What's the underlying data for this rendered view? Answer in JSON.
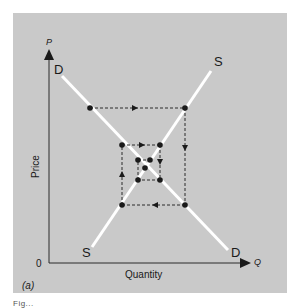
{
  "figure": {
    "panel_label": "(a)",
    "background_color": "#c9c9c9",
    "curve_color": "#ffffff",
    "axis_color": "#2a2a2a",
    "caption_fragment": "Fig..."
  },
  "axes": {
    "y_symbol": "P",
    "x_symbol": "Q",
    "y_label": "Price",
    "x_label": "Quantity",
    "origin_label": "0"
  },
  "curves": {
    "demand": {
      "label_top": "D",
      "label_bottom": "D",
      "direction": "downward-sloping"
    },
    "supply": {
      "label_top": "S",
      "label_bottom": "S",
      "direction": "upward-sloping"
    }
  },
  "cobweb": {
    "description": "Converging cobweb: dashed arrows spiral inward toward equilibrium",
    "path_points": [
      [
        90,
        108
      ],
      [
        185,
        108
      ],
      [
        185,
        205
      ],
      [
        122,
        205
      ],
      [
        122,
        145
      ],
      [
        160,
        145
      ],
      [
        160,
        180
      ],
      [
        138,
        180
      ],
      [
        138,
        160
      ],
      [
        150,
        160
      ]
    ],
    "equilibrium_point": [
      147,
      168
    ]
  }
}
